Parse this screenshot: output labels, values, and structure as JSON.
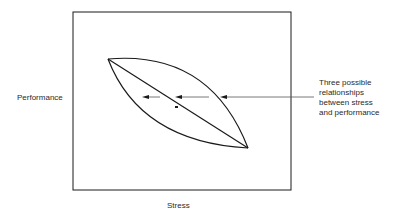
{
  "diagram": {
    "axis_labels": {
      "y": "Performance",
      "x": "Stress"
    },
    "annotation": {
      "text": "Three possible relationships between stress and performance",
      "lines": [
        "Three possible",
        "relationships",
        "between stress",
        "and performance"
      ]
    },
    "curves": [
      {
        "name": "upper-curve",
        "shape": "concave"
      },
      {
        "name": "straight-line",
        "shape": "linear"
      },
      {
        "name": "lower-curve",
        "shape": "convex"
      }
    ],
    "colors": {
      "line": "#1a1a1a",
      "arrow": "#555555",
      "background": "#ffffff"
    }
  }
}
